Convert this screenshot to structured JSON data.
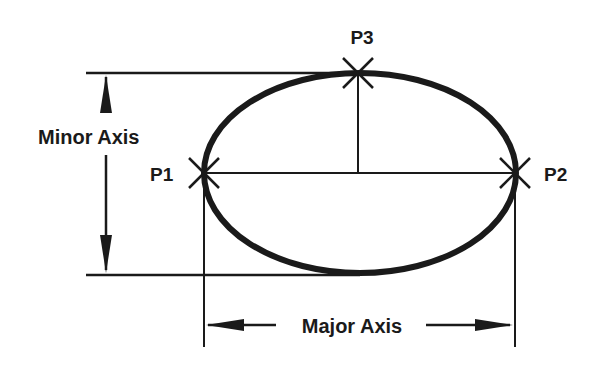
{
  "diagram": {
    "labels": {
      "p1": "P1",
      "p2": "P2",
      "p3": "P3",
      "minor_axis": "Minor Axis",
      "major_axis": "Major Axis"
    },
    "colors": {
      "stroke": "#1a1a1a",
      "background": "#ffffff"
    }
  }
}
